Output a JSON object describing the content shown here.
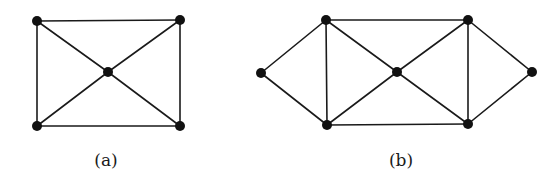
{
  "figure": {
    "graphs": [
      {
        "id": "a",
        "caption": "(a)",
        "caption_pos": [
          106,
          150
        ],
        "nodes": [
          {
            "id": "tl",
            "x": 37,
            "y": 21
          },
          {
            "id": "tr",
            "x": 180,
            "y": 20
          },
          {
            "id": "c",
            "x": 108,
            "y": 72
          },
          {
            "id": "bl",
            "x": 37,
            "y": 126
          },
          {
            "id": "br",
            "x": 180,
            "y": 126
          }
        ],
        "edges": [
          [
            "tl",
            "tr"
          ],
          [
            "tl",
            "bl"
          ],
          [
            "tr",
            "br"
          ],
          [
            "bl",
            "br"
          ],
          [
            "tl",
            "c"
          ],
          [
            "tr",
            "c"
          ],
          [
            "bl",
            "c"
          ],
          [
            "br",
            "c"
          ]
        ]
      },
      {
        "id": "b",
        "caption": "(b)",
        "caption_pos": [
          401,
          150
        ],
        "nodes": [
          {
            "id": "l",
            "x": 261,
            "y": 73
          },
          {
            "id": "tl",
            "x": 326,
            "y": 20
          },
          {
            "id": "tr",
            "x": 468,
            "y": 20
          },
          {
            "id": "c",
            "x": 397,
            "y": 72
          },
          {
            "id": "r",
            "x": 532,
            "y": 72
          },
          {
            "id": "bl",
            "x": 327,
            "y": 125
          },
          {
            "id": "br",
            "x": 468,
            "y": 124
          }
        ],
        "edges": [
          [
            "l",
            "tl"
          ],
          [
            "l",
            "bl"
          ],
          [
            "tl",
            "tr"
          ],
          [
            "tl",
            "bl"
          ],
          [
            "tl",
            "c"
          ],
          [
            "tr",
            "c"
          ],
          [
            "tr",
            "br"
          ],
          [
            "tr",
            "r"
          ],
          [
            "bl",
            "c"
          ],
          [
            "bl",
            "br"
          ],
          [
            "br",
            "c"
          ],
          [
            "br",
            "r"
          ]
        ]
      }
    ],
    "style": {
      "node_radius": 5,
      "edge_color": "#1a1a1a",
      "node_color": "#111111",
      "background": "#ffffff"
    }
  }
}
